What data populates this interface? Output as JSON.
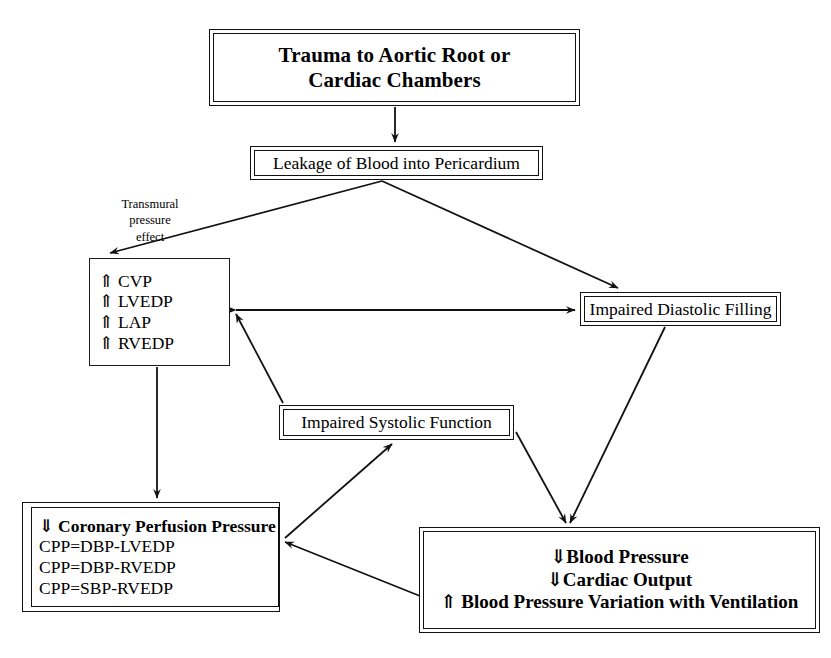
{
  "diagram": {
    "stroke_color": "#111111",
    "background_color": "#ffffff"
  },
  "nodes": {
    "trauma": {
      "line1": "Trauma to Aortic Root or",
      "line2": "Cardiac Chambers"
    },
    "leakage": {
      "line1": "Leakage of Blood into Pericardium"
    },
    "transmural_label": {
      "line1": "Transmural",
      "line2": "pressure",
      "line3": "effect"
    },
    "pressures": {
      "line1": "⇑ CVP",
      "line2": "⇑ LVEDP",
      "line3": "⇑ LAP",
      "line4": "⇑ RVEDP"
    },
    "diastolic": {
      "line1": "Impaired Diastolic Filling"
    },
    "systolic": {
      "line1": "Impaired Systolic Function"
    },
    "cpp": {
      "line1": "⇓ Coronary Perfusion Pressure",
      "line2": "CPP=DBP-LVEDP",
      "line3": "CPP=DBP-RVEDP",
      "line4": "CPP=SBP-RVEDP"
    },
    "outcome": {
      "line1": "⇓Blood Pressure",
      "line2": "⇓Cardiac Output",
      "line3": "⇑ Blood Pressure Variation with Ventilation"
    }
  },
  "edges": [
    {
      "name": "trauma-to-leakage",
      "from": "trauma",
      "to": "leakage",
      "style": "single-head"
    },
    {
      "name": "leakage-to-pressures",
      "from": "leakage",
      "to": "pressures",
      "style": "single-head"
    },
    {
      "name": "leakage-to-diastolic",
      "from": "leakage",
      "to": "diastolic",
      "style": "single-head"
    },
    {
      "name": "pressures-to-diastolic",
      "from": "pressures",
      "to": "diastolic",
      "style": "double-head"
    },
    {
      "name": "systolic-to-pressures",
      "from": "systolic",
      "to": "pressures",
      "style": "single-head"
    },
    {
      "name": "pressures-to-cpp",
      "from": "pressures",
      "to": "cpp",
      "style": "single-head"
    },
    {
      "name": "diastolic-to-outcome",
      "from": "diastolic",
      "to": "outcome",
      "style": "single-head"
    },
    {
      "name": "systolic-to-outcome",
      "from": "systolic",
      "to": "outcome",
      "style": "single-head"
    },
    {
      "name": "cpp-to-systolic",
      "from": "cpp",
      "to": "systolic",
      "style": "single-head"
    },
    {
      "name": "outcome-to-cpp",
      "from": "outcome",
      "to": "cpp",
      "style": "single-head"
    }
  ]
}
